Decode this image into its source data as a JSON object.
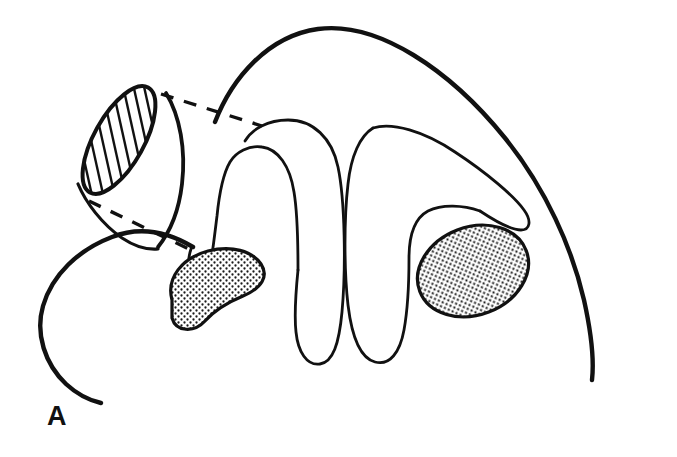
{
  "figure": {
    "domain": "diagram",
    "kind": "anatomical-line-drawing",
    "panel_label": "A",
    "background_color": "#ffffff",
    "ink_color": "#111111",
    "stipple_fill_color": "#1a1a1a",
    "hatch_fill_color": "#1a1a1a",
    "caption": "",
    "title": ""
  },
  "elements": {
    "outer_contour": {
      "name": "outer body contour",
      "stroke_width": 4.2,
      "description": "Large open curve forming the dome-shaped outer boundary, peaking near the top centre and descending to open ends at lower left and lower right."
    },
    "left_lower_contour": {
      "name": "lower left outer contour",
      "stroke_width": 4.2,
      "description": "Curve sweeping from beneath the cut tube down and around to an open end at the lower left."
    },
    "cut_tube": {
      "name": "cut tubular structure",
      "stroke_width": 3.6,
      "cross_section_label": "hatched ellipse",
      "hatch_line_count": 12,
      "hatch_angle_deg": 75,
      "description": "Obliquely sectioned tube whose cut face is drawn as a hatched ellipse at the upper left; the tube wall continues down and to the right."
    },
    "dashed_leader_upper": {
      "name": "upper dashed leader line",
      "dash_pattern": "12 10",
      "stroke_width": 3.2
    },
    "dashed_leader_lower": {
      "name": "lower dashed leader line",
      "dash_pattern": "12 10",
      "stroke_width": 3.2
    },
    "fold_left": {
      "name": "left folded septum",
      "stroke_width": 2.6,
      "description": "Narrow inverted-U shaped folded sheet with rounded apex at top and rounded free ends below."
    },
    "fold_right": {
      "name": "right folded septum",
      "stroke_width": 2.6,
      "description": "Second narrow inverted-U shaped folded sheet, wider, with apex pointing up-left and a tapered tip extending to the right."
    },
    "stipple_left": {
      "name": "left stippled structure",
      "shape": "kidney / bean",
      "rotation_deg": -24,
      "stroke_width": 3.0
    },
    "stipple_right": {
      "name": "right stippled structure",
      "shape": "oval",
      "rotation_deg": -20,
      "stroke_width": 3.0
    }
  }
}
